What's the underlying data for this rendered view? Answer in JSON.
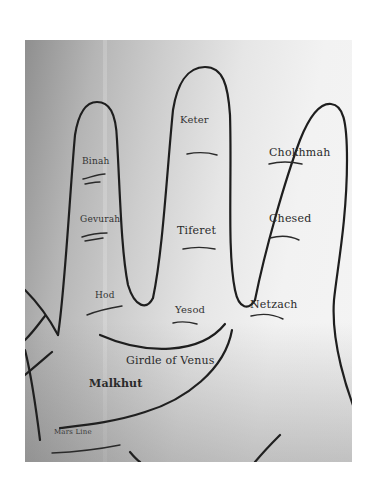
{
  "figure": {
    "type": "palmistry-kabbalah-hand-diagram",
    "labels": {
      "keter": "Keter",
      "binah": "Binah",
      "chokhmah": "Chokhmah",
      "gevurah": "Gevurah",
      "tiferet": "Tiferet",
      "chesed": "Chesed",
      "hod": "Hod",
      "yesod": "Yesod",
      "netzach": "Netzach",
      "girdle_of_venus": "Girdle of Venus",
      "malkhut": "Malkhut",
      "mars_line": "Mars Line"
    }
  }
}
